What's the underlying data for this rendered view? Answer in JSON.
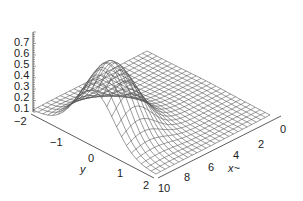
{
  "chart_data": {
    "type": "surface3d",
    "title": "",
    "xlabel": "x~",
    "ylabel": "y",
    "zlabel": "",
    "x_range": [
      0,
      10
    ],
    "y_range": [
      -2,
      2
    ],
    "z_range": [
      0,
      0.75
    ],
    "x_ticks": [
      "0",
      "2",
      "4",
      "6",
      "8",
      "10"
    ],
    "y_ticks": [
      "-2",
      "-1",
      "0",
      "1",
      "2"
    ],
    "z_ticks": [
      "0.1",
      "0.2",
      "0.3",
      "0.4",
      "0.5",
      "0.6",
      "0.7"
    ],
    "grid_lines_x": 25,
    "grid_lines_y": 25,
    "style": "wireframe",
    "line_color": "#555555",
    "peak": {
      "x": 1.5,
      "y": 0,
      "z": 0.7
    }
  },
  "labels": {
    "z": [
      "0.7",
      "0.6",
      "0.5",
      "0.4",
      "0.3",
      "0.2",
      "0.1"
    ],
    "y": [
      "−2",
      "−1",
      "0",
      "1",
      "2"
    ],
    "x": [
      "0",
      "2",
      "4",
      "6",
      "8",
      "10"
    ],
    "xtitle": "x~",
    "ytitle": "y"
  }
}
